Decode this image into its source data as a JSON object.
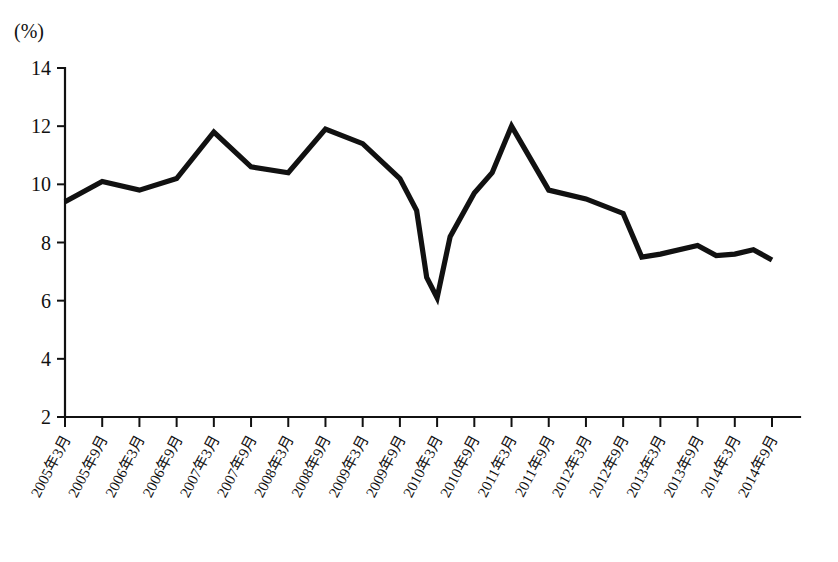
{
  "chart_data": {
    "type": "line",
    "title": "",
    "subtitle": "",
    "xlabel": "",
    "ylabel": "",
    "unit_label": "(%)",
    "ylim": [
      2,
      14
    ],
    "yticks": [
      2,
      4,
      6,
      8,
      10,
      12,
      14
    ],
    "ytick_labels": [
      "2",
      "4",
      "6",
      "8",
      "10",
      "12",
      "14"
    ],
    "grid": false,
    "legend": null,
    "legend_position": "none",
    "line_color": "#111111",
    "background_color": "#ffffff",
    "categories": [
      "2005年3月",
      "2005年9月",
      "2006年3月",
      "2006年9月",
      "2007年3月",
      "2007年9月",
      "2008年3月",
      "2008年9月",
      "2009年3月",
      "2009年9月",
      "2010年3月",
      "2010年9月",
      "2011年3月",
      "2011年9月",
      "2012年3月",
      "2012年9月",
      "2013年3月",
      "2013年9月",
      "2014年3月",
      "2014年9月"
    ],
    "values": [
      9.4,
      10.1,
      9.8,
      10.2,
      11.8,
      10.6,
      10.4,
      11.9,
      11.4,
      10.2,
      6.1,
      9.7,
      12.0,
      9.8,
      9.5,
      9.0,
      7.6,
      7.9,
      7.6,
      7.4
    ],
    "annotations": [
      {
        "label": "peak",
        "category": "2006年9月",
        "value": 11.8
      },
      {
        "label": "peak",
        "category": "2008年9月",
        "value": 11.9
      },
      {
        "label": "trough",
        "category": "2010年3月",
        "value": 6.1
      },
      {
        "label": "peak",
        "category": "2011年3月",
        "value": 12.0
      }
    ],
    "interpolation_points": [
      {
        "x": 9.45,
        "y": 9.1
      },
      {
        "x": 9.72,
        "y": 6.8
      },
      {
        "x": 10.35,
        "y": 8.2
      },
      {
        "x": 11.48,
        "y": 10.4
      },
      {
        "x": 15.5,
        "y": 7.5
      },
      {
        "x": 17.5,
        "y": 7.55
      },
      {
        "x": 18.5,
        "y": 7.75
      }
    ]
  }
}
